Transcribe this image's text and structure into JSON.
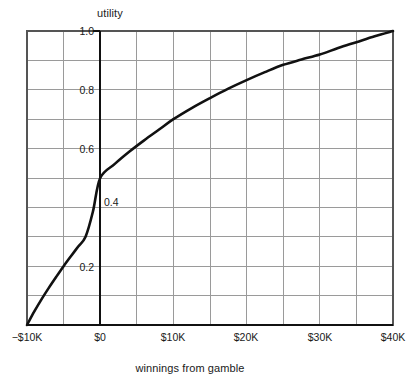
{
  "chart_data": {
    "type": "line",
    "title": "",
    "xlabel": "winnings from gamble",
    "ylabel": "utility",
    "xlim": [
      -10000,
      40000
    ],
    "ylim": [
      0.0,
      1.0
    ],
    "grid": true,
    "legend": null,
    "x_tick_labels": [
      "−$10K",
      "$0",
      "$10K",
      "$20K",
      "$30K",
      "$40K"
    ],
    "x_tick_values": [
      -10000,
      0,
      10000,
      20000,
      30000,
      40000
    ],
    "y_tick_labels": [
      "0.2",
      "0.4",
      "0.6",
      "0.8",
      "1.0"
    ],
    "y_tick_values": [
      0.2,
      0.4,
      0.6,
      0.8,
      1.0
    ],
    "x_minor_step": 5000,
    "y_minor_step": 0.1,
    "series": [
      {
        "name": "utility curve",
        "color": "#111111",
        "x": [
          -10000,
          -9000,
          -8000,
          -7000,
          -6000,
          -5000,
          -4000,
          -3000,
          -2000,
          -1000,
          0,
          2000,
          4000,
          6000,
          8000,
          10000,
          12500,
          15000,
          17500,
          20000,
          22500,
          25000,
          27500,
          30000,
          32500,
          35000,
          37500,
          40000
        ],
        "y": [
          0.0,
          0.046,
          0.088,
          0.127,
          0.164,
          0.2,
          0.234,
          0.267,
          0.3,
          0.385,
          0.5,
          0.548,
          0.59,
          0.628,
          0.664,
          0.7,
          0.738,
          0.772,
          0.804,
          0.833,
          0.86,
          0.885,
          0.903,
          0.92,
          0.942,
          0.962,
          0.982,
          1.0
        ]
      }
    ],
    "annotations": [
      {
        "text": "0.4",
        "note": "placed right of the $0 axis to avoid the curve"
      }
    ],
    "colors": {
      "curve": "#111111",
      "gridline": "#9a9a9a",
      "frame": "#4a4a4a",
      "zero_axis": "#111111",
      "background": "#ffffff"
    }
  },
  "chart": {
    "y_axis_title": "utility",
    "x_axis_title": "winnings from gamble",
    "x_ticks": [
      {
        "label": "−$10K",
        "left": -3
      },
      {
        "label": "$0",
        "left": 70
      },
      {
        "label": "$10K",
        "left": 143
      },
      {
        "label": "$20K",
        "left": 216
      },
      {
        "label": "$30K",
        "left": 290
      },
      {
        "label": "$40K",
        "left": 363
      }
    ],
    "y_ticks": [
      {
        "label": "1.0",
        "top": 25,
        "left": 60,
        "side": "left"
      },
      {
        "label": "0.8",
        "top": 84,
        "left": 60,
        "side": "left"
      },
      {
        "label": "0.6",
        "top": 143,
        "left": 60,
        "side": "left"
      },
      {
        "label": "0.4",
        "top": 196,
        "left": 104,
        "side": "right"
      },
      {
        "label": "0.2",
        "top": 261,
        "left": 60,
        "side": "left"
      }
    ]
  }
}
